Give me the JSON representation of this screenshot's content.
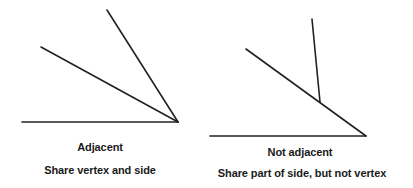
{
  "colors": {
    "line": "#222222",
    "text": "#1a1a1a",
    "background": "#ffffff"
  },
  "left_figure": {
    "title": "Adjacent",
    "caption": "Share vertex and side",
    "segments": [
      {
        "name": "base-ray",
        "x1": 22,
        "y1": 122,
        "x2": 178,
        "y2": 122
      },
      {
        "name": "middle-ray",
        "x1": 41,
        "y1": 47,
        "x2": 178,
        "y2": 122
      },
      {
        "name": "upper-ray",
        "x1": 107,
        "y1": 10,
        "x2": 178,
        "y2": 122
      }
    ]
  },
  "right_figure": {
    "title": "Not adjacent",
    "caption": "Share part of side, but not vertex",
    "segments": [
      {
        "name": "base-ray",
        "x1": 210,
        "y1": 136,
        "x2": 366,
        "y2": 136
      },
      {
        "name": "diagonal-ray",
        "x1": 246,
        "y1": 49,
        "x2": 366,
        "y2": 136
      },
      {
        "name": "offset-ray",
        "x1": 312,
        "y1": 19,
        "x2": 320,
        "y2": 102
      }
    ]
  }
}
